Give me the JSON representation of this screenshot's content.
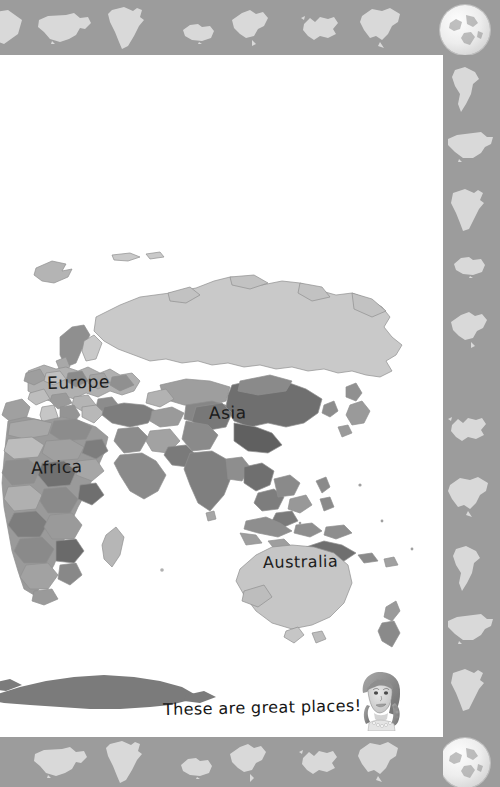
{
  "page": {
    "background_color": "#9c9c9c",
    "paper_color": "#ffffff",
    "caption": "These are great places!"
  },
  "map": {
    "type": "world-map-eastern-hemisphere",
    "projection_note": "Eurasia, Africa, Australia centred view",
    "labels": [
      {
        "name": "Europe",
        "text": "Europe"
      },
      {
        "name": "Asia",
        "text": "Asia"
      },
      {
        "name": "Africa",
        "text": "Africa"
      },
      {
        "name": "Australia",
        "text": "Australia"
      }
    ],
    "palette": {
      "land_light": "#d2d2d2",
      "land_mid": "#b4b4b4",
      "land_dark": "#8a8a8a",
      "land_darker": "#6f6f6f",
      "antarctica": "#7b7b7b",
      "outline": "#8f8f8f"
    }
  },
  "decor": {
    "band_color": "#9c9c9c",
    "silhouette_color": "#ffffff",
    "top_shapes": [
      "partial-shape",
      "usa",
      "africa",
      "australia",
      "china",
      "europe",
      "north-america"
    ],
    "bottom_shapes": [
      "usa",
      "africa",
      "australia",
      "china",
      "europe",
      "north-america"
    ],
    "right_shapes": [
      "south-america",
      "usa",
      "africa",
      "australia",
      "china",
      "europe",
      "north-america",
      "south-america",
      "usa",
      "africa"
    ],
    "globe_positions": [
      "top-right",
      "bottom-right"
    ]
  },
  "portrait": {
    "name": "girl-with-braids",
    "style": "pencil-sketch"
  }
}
